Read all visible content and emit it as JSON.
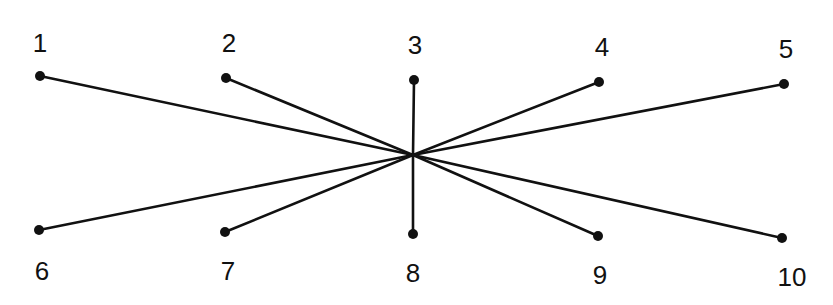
{
  "diagram": {
    "type": "star-graph",
    "colors": {
      "line": "#111111",
      "node": "#111111",
      "background": "#ffffff"
    },
    "hub": {
      "x": 413,
      "y": 155
    },
    "nodes": [
      {
        "id": "1",
        "label": "1",
        "x": 40,
        "y": 76,
        "lx": 40,
        "ly": 52
      },
      {
        "id": "2",
        "label": "2",
        "x": 226,
        "y": 78,
        "lx": 229,
        "ly": 52
      },
      {
        "id": "3",
        "label": "3",
        "x": 414,
        "y": 80,
        "lx": 415,
        "ly": 54
      },
      {
        "id": "4",
        "label": "4",
        "x": 599,
        "y": 82,
        "lx": 602,
        "ly": 56
      },
      {
        "id": "5",
        "label": "5",
        "x": 784,
        "y": 84,
        "lx": 786,
        "ly": 58
      },
      {
        "id": "6",
        "label": "6",
        "x": 39,
        "y": 230,
        "lx": 42,
        "ly": 280
      },
      {
        "id": "7",
        "label": "7",
        "x": 225,
        "y": 232,
        "lx": 228,
        "ly": 280
      },
      {
        "id": "8",
        "label": "8",
        "x": 413,
        "y": 234,
        "lx": 413,
        "ly": 282
      },
      {
        "id": "9",
        "label": "9",
        "x": 598,
        "y": 236,
        "lx": 600,
        "ly": 284
      },
      {
        "id": "10",
        "label": "10",
        "x": 782,
        "y": 238,
        "lx": 792,
        "ly": 286
      }
    ]
  }
}
